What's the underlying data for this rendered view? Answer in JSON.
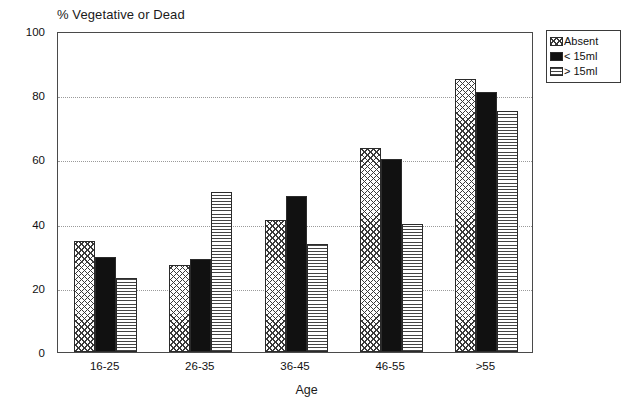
{
  "chart_data": {
    "type": "bar",
    "title": "% Vegetative or Dead",
    "xlabel": "Age",
    "ylabel": "",
    "categories": [
      "16-25",
      "26-35",
      "36-45",
      "46-55",
      ">55"
    ],
    "series": [
      {
        "name": "Absent",
        "pattern": "cross-hatch",
        "values": [
          34.5,
          27,
          41,
          63.5,
          85
        ]
      },
      {
        "name": "< 15ml",
        "pattern": "solid-black",
        "values": [
          29.5,
          29,
          48.5,
          60,
          81
        ]
      },
      {
        "name": "> 15ml",
        "pattern": "horizontal-lines",
        "values": [
          23,
          50,
          33.5,
          40,
          75
        ]
      }
    ],
    "ylim": [
      0,
      100
    ],
    "yticks": [
      0,
      20,
      40,
      60,
      80,
      100
    ],
    "ytick_labels": [
      "0",
      "20",
      "40",
      "60",
      "80",
      "100"
    ],
    "gridlines": [
      20,
      40,
      60,
      80
    ],
    "grid": true,
    "legend_position": "right-top",
    "colors": {
      "axis": "#4a4a4a",
      "grid": "#9a9a9a",
      "bar_outline": "#2b2b2b",
      "solid_fill": "#111111",
      "background": "#ffffff"
    }
  },
  "legend": {
    "items": [
      {
        "label": "Absent"
      },
      {
        "label": "< 15ml"
      },
      {
        "label": "> 15ml"
      }
    ]
  }
}
